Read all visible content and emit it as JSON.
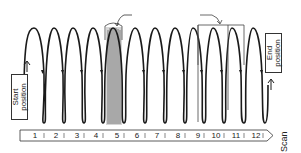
{
  "diagram": {
    "type": "scan-path",
    "labels": {
      "start": [
        "Start",
        "position"
      ],
      "end": [
        "End",
        "position"
      ],
      "scan_axis": "Scan"
    },
    "scale": {
      "ticks": [
        "1",
        "2",
        "3",
        "4",
        "5",
        "6",
        "7",
        "8",
        "9",
        "10",
        "11",
        "12"
      ]
    },
    "wave": {
      "cycles": 12,
      "dense_cycle_index": 5,
      "bracketed_cycles": [
        9,
        11
      ],
      "peak_y": 28,
      "trough_y": 123
    },
    "colors": {
      "stroke": "#1a1a1a",
      "dense_fill": "#bdbdbd",
      "background": "#ffffff"
    }
  }
}
